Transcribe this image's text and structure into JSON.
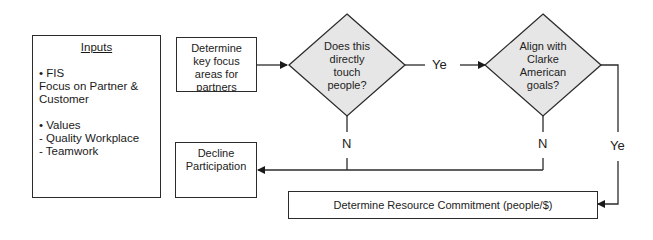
{
  "diagram": {
    "inputs_box": {
      "title": "Inputs",
      "groups": [
        {
          "bullet": "• FIS",
          "lines": [
            "Focus on Partner &",
            "Customer"
          ]
        },
        {
          "bullet": "• Values",
          "lines": [
            "- Quality Workplace",
            "- Teamwork"
          ]
        }
      ]
    },
    "nodes": {
      "determine_focus": {
        "lines": [
          "Determine",
          "key focus",
          "areas for",
          "partners"
        ]
      },
      "decision_touch_people": {
        "lines": [
          "Does this",
          "directly",
          "touch",
          "people?"
        ]
      },
      "decision_align_goals": {
        "lines": [
          "Align with",
          "Clarke",
          "American",
          "goals?"
        ]
      },
      "decline": {
        "lines": [
          "Decline",
          "Participation"
        ]
      },
      "resource_commitment": {
        "text": "Determine Resource Commitment (people/$)"
      }
    },
    "edge_labels": {
      "yes_1": "Ye",
      "yes_2": "Ye",
      "no_1": "N",
      "no_2": "N"
    },
    "colors": {
      "stroke": "#2b2b2b",
      "diamond_fill": "#e6e6e6",
      "box_fill": "#ffffff"
    }
  }
}
